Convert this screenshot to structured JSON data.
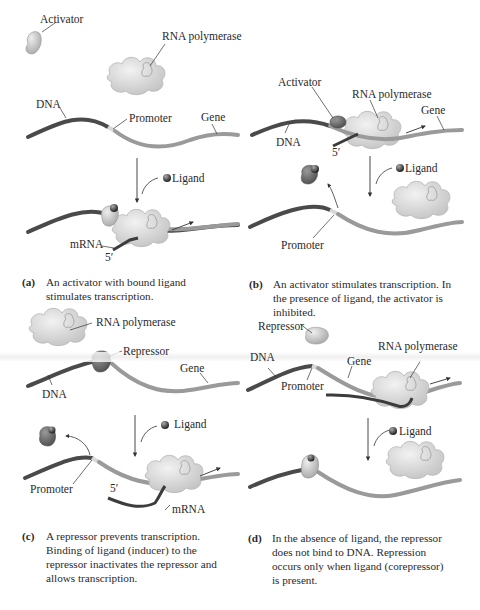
{
  "figure": {
    "colors": {
      "dna_dark": "#4a4a4a",
      "dna_gene": "#9a9a9a",
      "promoter": "#d8d8d8",
      "polymerase": "#d6d6d6",
      "activator": "#bdbdbd",
      "repressor": "#6e6e6e",
      "ligand": "#3a3a3a",
      "mrna": "#3c3c3c"
    },
    "panels": [
      {
        "id": "a",
        "labels": {
          "activator": "Activator",
          "rna_polymerase": "RNA polymerase",
          "dna": "DNA",
          "promoter": "Promoter",
          "gene": "Gene",
          "ligand": "Ligand",
          "mrna": "mRNA",
          "five_prime": "5′"
        },
        "caption_tag": "(a)",
        "caption": "An activator with bound ligand stimulates transcription.",
        "caption_lines": [
          "An activator with bound ligand",
          "stimulates transcription."
        ]
      },
      {
        "id": "b",
        "labels": {
          "activator": "Activator",
          "rna_polymerase": "RNA polymerase",
          "dna": "DNA",
          "gene": "Gene",
          "five_prime": "5′",
          "ligand": "Ligand",
          "promoter": "Promoter"
        },
        "caption_tag": "(b)",
        "caption": "An activator stimulates transcription. In the presence of ligand, the activator is inhibited.",
        "caption_lines": [
          "An activator stimulates transcription. In",
          "the presence of ligand, the activator is",
          "inhibited."
        ]
      },
      {
        "id": "c",
        "labels": {
          "rna_polymerase": "RNA polymerase",
          "repressor": "Repressor",
          "gene": "Gene",
          "dna": "DNA",
          "ligand": "Ligand",
          "promoter": "Promoter",
          "five_prime": "5′",
          "mrna": "mRNA"
        },
        "caption_tag": "(c)",
        "caption": "A repressor prevents transcription. Binding of ligand (inducer) to the repressor inactivates the repressor and allows transcription.",
        "caption_lines": [
          "A repressor prevents transcription.",
          "Binding of ligand (inducer) to the",
          "repressor inactivates the repressor and",
          "allows transcription."
        ]
      },
      {
        "id": "d",
        "labels": {
          "repressor": "Repressor",
          "dna": "DNA",
          "gene": "Gene",
          "rna_polymerase": "RNA polymerase",
          "promoter": "Promoter",
          "ligand": "Ligand"
        },
        "caption_tag": "(d)",
        "caption": "In the absence of ligand, the repressor does not bind to DNA. Repression occurs only when ligand (corepressor) is present.",
        "caption_lines": [
          "In the absence of ligand, the repressor",
          "does not bind to DNA. Repression",
          "occurs only when ligand (corepressor)",
          "is present."
        ]
      }
    ]
  }
}
